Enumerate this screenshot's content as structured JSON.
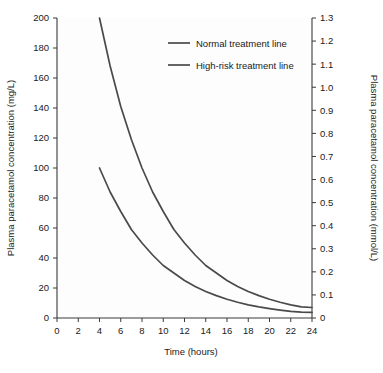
{
  "chart_data": {
    "type": "line",
    "title": "",
    "xlabel": "Time (hours)",
    "ylabel": "Plasma paracetamol concentration (mg/L)",
    "ylabel_right": "Plasma paracetamol concentration (mmol/L)",
    "xlim": [
      0,
      24
    ],
    "ylim": [
      0,
      200
    ],
    "ylim_right": [
      0,
      1.3
    ],
    "grid": false,
    "legend_position": "top-center",
    "xticks": [
      0,
      2,
      4,
      6,
      8,
      10,
      12,
      14,
      16,
      18,
      20,
      22,
      24
    ],
    "xtick_labels": [
      "0",
      "2",
      "4",
      "6",
      "8",
      "10",
      "12",
      "14",
      "16",
      "18",
      "20",
      "22",
      "24"
    ],
    "yticks": [
      0,
      20,
      40,
      60,
      80,
      100,
      120,
      140,
      160,
      180,
      200
    ],
    "ytick_labels": [
      "0",
      "20",
      "40",
      "60",
      "80",
      "100",
      "120",
      "140",
      "160",
      "180",
      "200"
    ],
    "yticks_right": [
      0,
      0.1,
      0.2,
      0.3,
      0.4,
      0.5,
      0.6,
      0.7,
      0.8,
      0.9,
      1.0,
      1.1,
      1.2,
      1.3
    ],
    "ytick_labels_right": [
      "0",
      "0.1",
      "0.2",
      "0.3",
      "0.4",
      "0.5",
      "0.6",
      "0.7",
      "0.8",
      "0.9",
      "1.0",
      "1.1",
      "1.2",
      "1.3"
    ],
    "series": [
      {
        "name": "Normal treatment line",
        "color": "#4a4a4a",
        "x": [
          4,
          5,
          6,
          7,
          8,
          9,
          10,
          11,
          12,
          13,
          14,
          15,
          16,
          17,
          18,
          19,
          20,
          21,
          22,
          23,
          24
        ],
        "values": [
          200,
          168,
          141,
          119,
          100,
          84,
          71,
          59,
          50,
          42,
          35,
          30,
          25,
          21,
          17.7,
          14.9,
          12.5,
          10.5,
          8.8,
          7.4,
          7.0
        ]
      },
      {
        "name": "High-risk treatment line",
        "color": "#4a4a4a",
        "x": [
          4,
          5,
          6,
          7,
          8,
          9,
          10,
          11,
          12,
          13,
          14,
          15,
          16,
          17,
          18,
          19,
          20,
          21,
          22,
          23,
          24
        ],
        "values": [
          100,
          84,
          71,
          59,
          50,
          42,
          35,
          30,
          25,
          21,
          17.7,
          14.9,
          12.5,
          10.5,
          8.8,
          7.4,
          6.3,
          5.3,
          4.4,
          3.9,
          3.7
        ]
      }
    ],
    "legend": [
      {
        "label": "Normal treatment line",
        "color": "#4a4a4a"
      },
      {
        "label": "High-risk treatment line",
        "color": "#4a4a4a"
      }
    ]
  },
  "colors": {
    "axis": "#3a3a3a",
    "curve": "#4a4a4a",
    "text": "#1a1a1a",
    "background": "#ffffff"
  }
}
